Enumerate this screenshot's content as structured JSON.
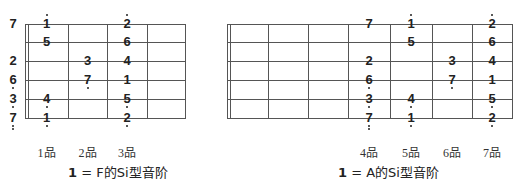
{
  "diagrams": [
    {
      "id": "F",
      "caption": {
        "one": "1",
        "rest": " = F的Si型音阶"
      },
      "fret_labels": [
        "1品",
        "2品",
        "3品"
      ],
      "frets_drawn": 4,
      "open_notes": [
        {
          "string": 1,
          "note": "7",
          "dots_above": 0,
          "dots_below": 0
        },
        {
          "string": 3,
          "note": "2",
          "dots_above": 0,
          "dots_below": 0
        },
        {
          "string": 4,
          "note": "6",
          "dots_above": 0,
          "dots_below": 1
        },
        {
          "string": 5,
          "note": "3",
          "dots_above": 0,
          "dots_below": 1
        },
        {
          "string": 6,
          "note": "7",
          "dots_above": 0,
          "dots_below": 2
        }
      ],
      "notes": [
        {
          "string": 1,
          "fret": 1,
          "note": "1",
          "dots_above": 1,
          "dots_below": 0
        },
        {
          "string": 2,
          "fret": 1,
          "note": "5",
          "dots_above": 0,
          "dots_below": 0
        },
        {
          "string": 5,
          "fret": 1,
          "note": "4",
          "dots_above": 0,
          "dots_below": 1
        },
        {
          "string": 6,
          "fret": 1,
          "note": "1",
          "dots_above": 0,
          "dots_below": 1
        },
        {
          "string": 3,
          "fret": 2,
          "note": "3",
          "dots_above": 0,
          "dots_below": 0
        },
        {
          "string": 4,
          "fret": 2,
          "note": "7",
          "dots_above": 0,
          "dots_below": 1
        },
        {
          "string": 1,
          "fret": 3,
          "note": "2",
          "dots_above": 1,
          "dots_below": 0
        },
        {
          "string": 2,
          "fret": 3,
          "note": "6",
          "dots_above": 0,
          "dots_below": 0
        },
        {
          "string": 3,
          "fret": 3,
          "note": "4",
          "dots_above": 0,
          "dots_below": 0
        },
        {
          "string": 4,
          "fret": 3,
          "note": "1",
          "dots_above": 0,
          "dots_below": 0
        },
        {
          "string": 5,
          "fret": 3,
          "note": "5",
          "dots_above": 0,
          "dots_below": 1
        },
        {
          "string": 6,
          "fret": 3,
          "note": "2",
          "dots_above": 0,
          "dots_below": 1
        }
      ]
    },
    {
      "id": "A",
      "caption": {
        "one": "1",
        "rest": " = A的Si型音阶"
      },
      "fret_labels": [
        "4品",
        "5品",
        "6品",
        "7品"
      ],
      "frets_drawn": 7,
      "open_notes": [],
      "notes": [
        {
          "string": 1,
          "fret": 4,
          "note": "7",
          "dots_above": 0,
          "dots_below": 0
        },
        {
          "string": 3,
          "fret": 4,
          "note": "2",
          "dots_above": 0,
          "dots_below": 0
        },
        {
          "string": 4,
          "fret": 4,
          "note": "6",
          "dots_above": 0,
          "dots_below": 1
        },
        {
          "string": 5,
          "fret": 4,
          "note": "3",
          "dots_above": 0,
          "dots_below": 1
        },
        {
          "string": 6,
          "fret": 4,
          "note": "7",
          "dots_above": 0,
          "dots_below": 2
        },
        {
          "string": 1,
          "fret": 5,
          "note": "1",
          "dots_above": 1,
          "dots_below": 0
        },
        {
          "string": 2,
          "fret": 5,
          "note": "5",
          "dots_above": 0,
          "dots_below": 0
        },
        {
          "string": 5,
          "fret": 5,
          "note": "4",
          "dots_above": 0,
          "dots_below": 1
        },
        {
          "string": 6,
          "fret": 5,
          "note": "1",
          "dots_above": 0,
          "dots_below": 1
        },
        {
          "string": 3,
          "fret": 6,
          "note": "3",
          "dots_above": 0,
          "dots_below": 0
        },
        {
          "string": 4,
          "fret": 6,
          "note": "7",
          "dots_above": 0,
          "dots_below": 1
        },
        {
          "string": 1,
          "fret": 7,
          "note": "2",
          "dots_above": 1,
          "dots_below": 0
        },
        {
          "string": 2,
          "fret": 7,
          "note": "6",
          "dots_above": 0,
          "dots_below": 0
        },
        {
          "string": 3,
          "fret": 7,
          "note": "4",
          "dots_above": 0,
          "dots_below": 0
        },
        {
          "string": 4,
          "fret": 7,
          "note": "1",
          "dots_above": 0,
          "dots_below": 0
        },
        {
          "string": 5,
          "fret": 7,
          "note": "5",
          "dots_above": 0,
          "dots_below": 1
        },
        {
          "string": 6,
          "fret": 7,
          "note": "2",
          "dots_above": 0,
          "dots_below": 1
        }
      ]
    }
  ]
}
